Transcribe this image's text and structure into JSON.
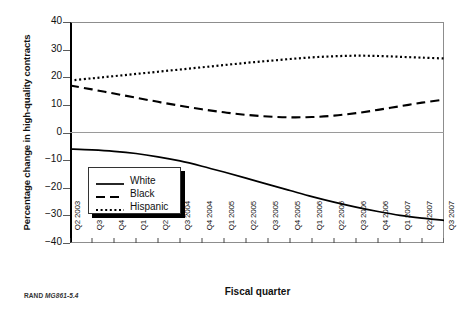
{
  "figure": {
    "credit_prefix": "RAND",
    "credit_id": "MG861-5.4"
  },
  "chart_data": {
    "type": "line",
    "title": "",
    "xlabel": "Fiscal quarter",
    "ylabel": "Percentage change in high-quality contracts",
    "ylim": [
      -40,
      40
    ],
    "ytick_values": [
      40,
      30,
      20,
      10,
      0,
      -10,
      -20,
      -30,
      -40
    ],
    "ytick_labels": [
      "40",
      "30",
      "20",
      "10",
      "0",
      "−10",
      "−20",
      "−30",
      "−40"
    ],
    "grid": false,
    "zero_line": true,
    "legend_position": "center-left",
    "categories": [
      "Q2 2003",
      "Q3 2003",
      "Q4 2003",
      "Q1 2004",
      "Q2 2004",
      "Q3 2004",
      "Q4 2004",
      "Q1 2005",
      "Q2 2005",
      "Q3 2005",
      "Q4 2005",
      "Q1 2006",
      "Q2 2006",
      "Q3 2006",
      "Q4 2006",
      "Q1 2007",
      "Q2 2007",
      "Q3 2007"
    ],
    "series": [
      {
        "name": "White",
        "style": "solid",
        "values": [
          -6.0,
          -6.3,
          -6.8,
          -7.6,
          -8.8,
          -10.3,
          -12.2,
          -14.3,
          -16.5,
          -18.8,
          -21.0,
          -23.2,
          -25.2,
          -27.0,
          -28.6,
          -30.0,
          -31.0,
          -31.8
        ]
      },
      {
        "name": "Black",
        "style": "dashed",
        "values": [
          17.0,
          15.6,
          14.1,
          12.6,
          11.1,
          9.7,
          8.4,
          7.3,
          6.4,
          5.8,
          5.5,
          5.6,
          6.1,
          7.0,
          8.2,
          9.5,
          10.8,
          11.9
        ]
      },
      {
        "name": "Hispanic",
        "style": "dotted",
        "values": [
          18.8,
          19.6,
          20.4,
          21.2,
          22.0,
          22.8,
          23.6,
          24.4,
          25.2,
          25.9,
          26.6,
          27.2,
          27.6,
          27.8,
          27.7,
          27.4,
          27.1,
          26.8
        ]
      }
    ],
    "legend_entries": [
      {
        "label": "White",
        "style": "solid"
      },
      {
        "label": "Black",
        "style": "dashed"
      },
      {
        "label": "Hispanic",
        "style": "dotted"
      }
    ]
  }
}
